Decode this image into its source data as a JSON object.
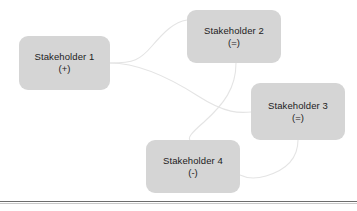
{
  "diagram": {
    "type": "stakeholder-relationship-map",
    "background_color": "#ffffff",
    "node_fill_color": "#d5d5d5",
    "node_text_color": "#1c1c1c",
    "connector_color": "#e2e2e2",
    "rule_color": "#6d6d6d",
    "nodes": [
      {
        "id": "node-1",
        "title": "Stakeholder 1",
        "valence": "(+)"
      },
      {
        "id": "node-2",
        "title": "Stakeholder 2",
        "valence": "(=)"
      },
      {
        "id": "node-3",
        "title": "Stakeholder 3",
        "valence": "(=)"
      },
      {
        "id": "node-4",
        "title": "Stakeholder 4",
        "valence": "(-)"
      }
    ],
    "connectors": [
      {
        "from": "node-1",
        "to": "node-2"
      },
      {
        "from": "node-1",
        "to": "node-3"
      },
      {
        "from": "node-2",
        "to": "node-4"
      },
      {
        "from": "node-3",
        "to": "node-4"
      }
    ]
  }
}
